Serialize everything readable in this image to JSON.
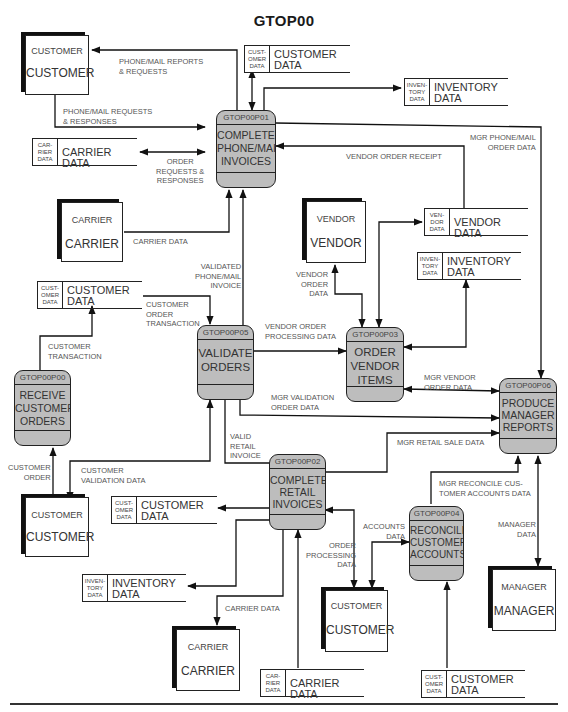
{
  "diagram": {
    "title": "GTOP00",
    "entities": [
      {
        "id": "customer-top",
        "small": "CUSTOMER",
        "big": "CUSTOMER"
      },
      {
        "id": "carrier-top",
        "small": "CARRIER",
        "big": "CARRIER"
      },
      {
        "id": "vendor",
        "small": "VENDOR",
        "big": "VENDOR"
      },
      {
        "id": "customer-left",
        "small": "CUSTOMER",
        "big": "CUSTOMER"
      },
      {
        "id": "customer-bottom",
        "small": "CUSTOMER",
        "big": "CUSTOMER"
      },
      {
        "id": "carrier-bottom",
        "small": "CARRIER",
        "big": "CARRIER"
      },
      {
        "id": "manager",
        "small": "MANAGER",
        "big": "MANAGER"
      }
    ],
    "processes": [
      {
        "id": "GTOP00P01",
        "name": "COMPLETE\nPHONE/MAIL\nINVOICES"
      },
      {
        "id": "GTOP00P05",
        "name": "VALIDATE\nORDERS"
      },
      {
        "id": "GTOP00P03",
        "name": "ORDER\nVENDOR\nITEMS"
      },
      {
        "id": "GTOP00P00",
        "name": "RECEIVE\nCUSTOMER\nORDERS"
      },
      {
        "id": "GTOP00P06",
        "name": "PRODUCE\nMANAGER\nREPORTS"
      },
      {
        "id": "GTOP00P02",
        "name": "COMPLETE\nRETAIL\nINVOICES"
      },
      {
        "id": "GTOP00P04",
        "name": "RECONCILE\nCUSTOMER\nACCOUNTS"
      }
    ],
    "stores": [
      {
        "tag": "CUST-\nOMER\nDATA",
        "name": "CUSTOMER\nDATA"
      },
      {
        "tag": "INVEN-\nTORY\nDATA",
        "name": "INVENTORY\nDATA"
      },
      {
        "tag": "CAR-\nRIER\nDATA",
        "name": "CARRIER DATA"
      },
      {
        "tag": "VEN-\nDOR\nDATA",
        "name": "VENDOR DATA"
      },
      {
        "tag": "INVEN-\nTORY\nDATA",
        "name": "INVENTORY\nDATA"
      },
      {
        "tag": "CUST-\nOMER\nDATA",
        "name": "CUSTOMER\nDATA"
      },
      {
        "tag": "CUST-\nOMER\nDATA",
        "name": "CUSTOMER\nDATA"
      },
      {
        "tag": "INVEN-\nTORY\nDATA",
        "name": "INVENTORY\nDATA"
      },
      {
        "tag": "CAR-\nRIER\nDATA",
        "name": "CARRIER DATA"
      },
      {
        "tag": "CUST-\nOMER\nDATA",
        "name": "CUSTOMER\nDATA"
      }
    ],
    "flows": [
      "PHONE/MAIL REPORTS\n& REQUESTS",
      "PHONE/MAIL REQUESTS\n& RESPONSES",
      "ORDER\nREQUESTS &\nRESPONSES",
      "CARRIER DATA",
      "MGR PHONE/MAIL\nORDER DATA",
      "VENDOR ORDER RECEIPT",
      "VALIDATED\nPHONE/MAIL\nINVOICE",
      "VENDOR\nORDER\nDATA",
      "CUSTOMER\nORDER\nTRANSACTION",
      "VENDOR ORDER\nPROCESSING DATA",
      "CUSTOMER\nTRANSACTION",
      "MGR VENDOR\nORDER DATA",
      "MGR VALIDATION\nORDER DATA",
      "VALID\nRETAIL\nINVOICE",
      "MGR RETAIL SALE DATA",
      "CUSTOMER\nORDER",
      "CUSTOMER\nVALIDATION DATA",
      "MGR RECONCILE CUS-\nTOMER ACCOUNTS DATA",
      "ACCOUNTS\nDATA",
      "MANAGER\nDATA",
      "ORDER\nPROCESSING\nDATA",
      "CARRIER DATA"
    ]
  }
}
